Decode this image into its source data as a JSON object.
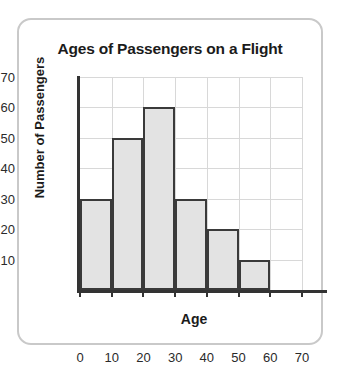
{
  "card": {
    "border_color": "#c9c9c9",
    "background": "#ffffff"
  },
  "chart_data": {
    "type": "bar",
    "title": "Ages of Passengers on a Flight",
    "xlabel": "Age",
    "ylabel": "Number of Passengers",
    "bin_width": 10,
    "bin_edges": [
      0,
      10,
      20,
      30,
      40,
      50,
      60,
      70
    ],
    "categories": [
      "0-10",
      "10-20",
      "20-30",
      "30-40",
      "40-50",
      "50-60",
      "60-70"
    ],
    "values": [
      30,
      50,
      60,
      30,
      20,
      10,
      0
    ],
    "xlim": [
      0,
      70
    ],
    "ylim": [
      0,
      70
    ],
    "xticks": [
      "0",
      "10",
      "20",
      "30",
      "40",
      "50",
      "60",
      "70"
    ],
    "yticks": [
      "10",
      "20",
      "30",
      "40",
      "50",
      "60",
      "70"
    ],
    "grid": true,
    "legend": null,
    "bar_fill_color": "#e3e3e3",
    "bar_edge_color": "#3a3a3a",
    "grid_color": "#d8d8d8",
    "axis_color": "#333333"
  }
}
